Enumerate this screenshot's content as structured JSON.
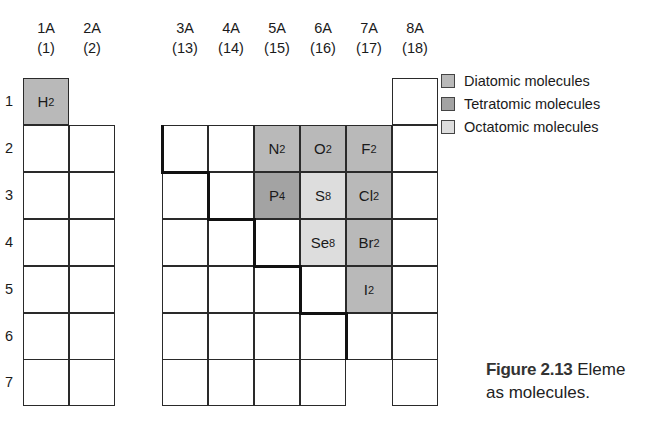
{
  "groups": [
    {
      "label": "1A",
      "num": "(1)"
    },
    {
      "label": "2A",
      "num": "(2)"
    },
    {
      "label": "3A",
      "num": "(13)"
    },
    {
      "label": "4A",
      "num": "(14)"
    },
    {
      "label": "5A",
      "num": "(15)"
    },
    {
      "label": "6A",
      "num": "(16)"
    },
    {
      "label": "7A",
      "num": "(17)"
    },
    {
      "label": "8A",
      "num": "(18)"
    }
  ],
  "periods": [
    "1",
    "2",
    "3",
    "4",
    "5",
    "6",
    "7"
  ],
  "molecules": {
    "H2": {
      "sym": "H",
      "sub": "2",
      "type": "diatomic"
    },
    "N2": {
      "sym": "N",
      "sub": "2",
      "type": "diatomic"
    },
    "O2": {
      "sym": "O",
      "sub": "2",
      "type": "diatomic"
    },
    "F2": {
      "sym": "F",
      "sub": "2",
      "type": "diatomic"
    },
    "P4": {
      "sym": "P",
      "sub": "4",
      "type": "tetratomic"
    },
    "S8": {
      "sym": "S",
      "sub": "8",
      "type": "octatomic"
    },
    "Cl2": {
      "sym": "Cl",
      "sub": "2",
      "type": "diatomic"
    },
    "Se8": {
      "sym": "Se",
      "sub": "8",
      "type": "octatomic"
    },
    "Br2": {
      "sym": "Br",
      "sub": "2",
      "type": "diatomic"
    },
    "I2": {
      "sym": "I",
      "sub": "2",
      "type": "diatomic"
    }
  },
  "legend": [
    {
      "label": "Diatomic molecules",
      "color": "#b9b9b9"
    },
    {
      "label": "Tetratomic molecules",
      "color": "#a3a3a3"
    },
    {
      "label": "Octatomic molecules",
      "color": "#dddddd"
    }
  ],
  "caption": {
    "figure": "Figure 2.13",
    "text_line1": "Eleme",
    "text_line2": "as molecules."
  }
}
